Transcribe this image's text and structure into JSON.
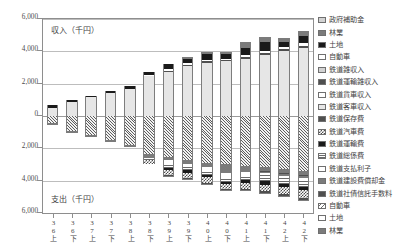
{
  "chart_data": {
    "type": "bar",
    "title": "",
    "subtitle": "",
    "orientation": "vertical-diverging-stacked",
    "xlabel": "",
    "ylabel": "",
    "ylim": [
      -6000,
      6000
    ],
    "yticks": [
      6000,
      4000,
      2000,
      0,
      2000,
      4000,
      6000
    ],
    "ytick_labels": [
      "6,000",
      "4,000",
      "2,000",
      "0",
      "2,000",
      "4,000",
      "6,000"
    ],
    "grid": true,
    "grid_axis": "y",
    "legend_position": "right",
    "unit_note_positive": "収入（千円）",
    "unit_note_negative": "支出（千円）",
    "categories": [
      "36上",
      "36下",
      "37上",
      "37下",
      "38上",
      "38下",
      "39上",
      "39下",
      "40上",
      "40下",
      "41上",
      "41下",
      "42上",
      "42下"
    ],
    "series": [
      {
        "name": "政府補助金",
        "side": "revenue",
        "pattern": "p-lightgray",
        "values": [
          0,
          0,
          0,
          0,
          0,
          0,
          0,
          0,
          0,
          0,
          0,
          0,
          0,
          0
        ]
      },
      {
        "name": "林業",
        "side": "revenue",
        "pattern": "p-mid",
        "values": [
          0,
          0,
          0,
          0,
          0,
          0,
          0,
          110,
          130,
          150,
          380,
          300,
          250,
          300
        ]
      },
      {
        "name": "土地",
        "side": "revenue",
        "pattern": "p-solid-black",
        "values": [
          150,
          120,
          110,
          150,
          180,
          210,
          330,
          300,
          330,
          260,
          420,
          520,
          300,
          460
        ]
      },
      {
        "name": "自動車",
        "side": "revenue",
        "pattern": "p-white",
        "values": [
          0,
          0,
          0,
          0,
          0,
          60,
          80,
          70,
          90,
          80,
          110,
          120,
          130,
          140
        ]
      },
      {
        "name": "鉄道雑収入",
        "side": "revenue",
        "pattern": "p-lightgray",
        "values": [
          0,
          0,
          0,
          0,
          0,
          0,
          0,
          0,
          0,
          0,
          0,
          0,
          0,
          0
        ]
      },
      {
        "name": "鉄道運輸雑収入",
        "side": "revenue",
        "pattern": "p-dark",
        "values": [
          0,
          0,
          0,
          0,
          0,
          0,
          60,
          80,
          90,
          70,
          100,
          120,
          130,
          150
        ]
      },
      {
        "name": "鉄道貨車収入",
        "side": "revenue",
        "pattern": "p-white",
        "values": [
          0,
          0,
          0,
          0,
          0,
          0,
          0,
          0,
          0,
          0,
          0,
          0,
          0,
          0
        ]
      },
      {
        "name": "鉄道客車収入",
        "side": "revenue",
        "pattern": "p-paleg",
        "values": [
          500,
          880,
          1150,
          1400,
          1700,
          2450,
          2750,
          3100,
          3300,
          3400,
          3550,
          3800,
          4000,
          4200
        ]
      },
      {
        "name": "鉄道保存費",
        "side": "expense",
        "pattern": "p-dark",
        "values": [
          0,
          0,
          0,
          0,
          0,
          0,
          110,
          120,
          130,
          120,
          150,
          170,
          160,
          190
        ]
      },
      {
        "name": "鉄道汽車費",
        "side": "expense",
        "pattern": "p-checker",
        "values": [
          0,
          0,
          0,
          0,
          0,
          200,
          300,
          330,
          360,
          330,
          400,
          430,
          420,
          450
        ]
      },
      {
        "name": "鉄道運輸費",
        "side": "expense",
        "pattern": "p-solid-black",
        "values": [
          0,
          0,
          0,
          0,
          0,
          0,
          150,
          140,
          170,
          130,
          190,
          200,
          200,
          220
        ]
      },
      {
        "name": "鉄道総係費",
        "side": "expense",
        "pattern": "p-hline",
        "values": [
          0,
          0,
          0,
          0,
          0,
          150,
          260,
          280,
          300,
          290,
          340,
          360,
          350,
          380
        ]
      },
      {
        "name": "鉄道支払利子",
        "side": "expense",
        "pattern": "p-white",
        "values": [
          0,
          0,
          0,
          0,
          0,
          0,
          220,
          130,
          150,
          260,
          130,
          140,
          140,
          150
        ]
      },
      {
        "name": "鉄道建設費償却金",
        "side": "expense",
        "pattern": "p-mid",
        "values": [
          0,
          0,
          0,
          0,
          0,
          0,
          0,
          60,
          70,
          60,
          90,
          100,
          110,
          120
        ]
      },
      {
        "name": "鉄道社債信託手数料",
        "side": "expense",
        "pattern": "p-dark",
        "values": [
          0,
          0,
          0,
          0,
          0,
          0,
          0,
          0,
          0,
          0,
          50,
          60,
          60,
          70
        ]
      },
      {
        "name": "自動車",
        "side": "expense",
        "pattern": "p-bdiag",
        "values": [
          0,
          0,
          0,
          0,
          0,
          0,
          0,
          0,
          0,
          0,
          0,
          0,
          0,
          0
        ]
      },
      {
        "name": "土地",
        "side": "expense",
        "pattern": "p-white",
        "values": [
          0,
          0,
          0,
          0,
          0,
          0,
          0,
          0,
          0,
          0,
          0,
          0,
          0,
          0
        ]
      },
      {
        "name": "林業",
        "side": "expense",
        "pattern": "p-mid",
        "values": [
          100,
          90,
          110,
          120,
          130,
          250,
          180,
          200,
          210,
          500,
          220,
          230,
          240,
          260
        ]
      },
      {
        "name": "鉄道営業費",
        "side": "expense",
        "pattern": "p-hdiag-dense",
        "values": [
          450,
          950,
          1200,
          1500,
          1800,
          2350,
          2550,
          2700,
          2900,
          2950,
          3100,
          3150,
          3300,
          3400
        ]
      }
    ]
  },
  "legend": {
    "items": [
      {
        "label": "政府補助金",
        "pattern": "p-lightgray"
      },
      {
        "label": "林業",
        "pattern": "p-mid"
      },
      {
        "label": "土地",
        "pattern": "p-solid-black"
      },
      {
        "label": "自動車",
        "pattern": "p-white"
      },
      {
        "label": "鉄道雑収入",
        "pattern": "p-lightgray"
      },
      {
        "label": "鉄道運輸雑収入",
        "pattern": "p-dark"
      },
      {
        "label": "鉄道貨車収入",
        "pattern": "p-white"
      },
      {
        "label": "鉄道客車収入",
        "pattern": "p-paleg"
      },
      {
        "label": "鉄道保存費",
        "pattern": "p-dark"
      },
      {
        "label": "鉄道汽車費",
        "pattern": "p-checker"
      },
      {
        "label": "鉄道運輸費",
        "pattern": "p-solid-black"
      },
      {
        "label": "鉄道総係費",
        "pattern": "p-hline"
      },
      {
        "label": "鉄道支払利子",
        "pattern": "p-white"
      },
      {
        "label": "鉄道建設費償却金",
        "pattern": "p-mid"
      },
      {
        "label": "鉄道社債信託手数料",
        "pattern": "p-dark"
      },
      {
        "label": "自動車",
        "pattern": "p-bdiag"
      },
      {
        "label": "土地",
        "pattern": "p-white"
      },
      {
        "label": "林業",
        "pattern": "p-mid"
      }
    ]
  }
}
